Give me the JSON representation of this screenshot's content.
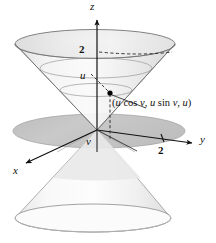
{
  "figure": {
    "background_color": "#ffffff",
    "axes": {
      "z": {
        "label": "z",
        "x": 90,
        "y": 2
      },
      "x": {
        "label": "x",
        "x": 13,
        "y": 166
      },
      "y": {
        "label": "y",
        "x": 200,
        "y": 136
      }
    },
    "ticks": [
      {
        "name": "z-tick-2",
        "label": "2",
        "x": 79,
        "y": 46
      },
      {
        "name": "y-tick-2",
        "label": "2",
        "x": 158,
        "y": 146
      }
    ],
    "annotations": [
      {
        "name": "u-label",
        "label": "u",
        "x": 80,
        "y": 73
      },
      {
        "name": "v-label",
        "label": "v",
        "x": 86,
        "y": 139
      }
    ],
    "point_label": {
      "name": "point-coordinates-label",
      "text": "(u cos v, u sin v, u)",
      "parts": {
        "open": "(",
        "u1": "u",
        "cos": " cos ",
        "v1": "v",
        "comma1": ", ",
        "u2": "u",
        "sin": " sin ",
        "v2": "v",
        "comma2": ", ",
        "u3": "u",
        "close": ")"
      },
      "x": 112,
      "y": 103
    },
    "colors": {
      "stroke": "#4a4a4a",
      "axis": "#111111",
      "surface_light": "#f2f2f2",
      "surface_mid": "#dcdcdc",
      "surface_dark": "#c9c9c9",
      "disk_gray": "#c4c4c4",
      "point": "#000000",
      "dashed": "#333333"
    },
    "geometry": {
      "origin": {
        "x": 97,
        "y": 130
      },
      "top_rim": {
        "cx": 95,
        "cy": 44,
        "rx": 80,
        "ry": 14.5
      },
      "bottom_rim": {
        "cx": 93,
        "cy": 218,
        "rx": 78,
        "ry": 14
      },
      "mid_disk": {
        "cx": 99,
        "cy": 131,
        "rx": 86,
        "ry": 17
      },
      "rings": [
        {
          "cy": 68,
          "rx": 56,
          "ry": 10
        },
        {
          "cy": 90,
          "rx": 36,
          "ry": 6.5
        }
      ],
      "point": {
        "x": 110,
        "y": 93
      },
      "point_foot": {
        "x": 110,
        "y": 137
      }
    }
  }
}
